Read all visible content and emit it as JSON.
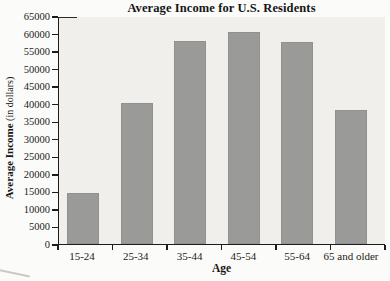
{
  "chart_data": {
    "type": "bar",
    "title": "Average Income for U.S. Residents",
    "xlabel": "Age",
    "ylabel": "Average Income (in dollars)",
    "ylabel_bold": "Average Income",
    "ylabel_regular": " (in dollars)",
    "categories": [
      "15-24",
      "25-34",
      "35-44",
      "45-54",
      "55-64",
      "65 and older"
    ],
    "values": [
      14800,
      40500,
      58200,
      61000,
      57900,
      38600
    ],
    "ylim": [
      0,
      65000
    ],
    "ytick_step": 5000,
    "grid": false,
    "legend_position": "none",
    "colors": {
      "bar": "#9a9a98",
      "bar_border": "#91918f",
      "plot_background": "#f0efeb",
      "page_background": "#fbfbf9",
      "axis": "#1c1c1c",
      "text": "#1b1b1b"
    }
  }
}
